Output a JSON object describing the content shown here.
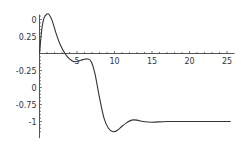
{
  "chart_data": {
    "type": "line",
    "title": "",
    "xlabel": "",
    "ylabel": "",
    "xlim": [
      0,
      26
    ],
    "ylim": [
      -1.2,
      0.6
    ],
    "grid": false,
    "legend": null,
    "x_ticks": [
      5,
      10,
      15,
      20,
      25
    ],
    "x_tick_labels": [
      "5",
      "10",
      "15",
      "20",
      "25"
    ],
    "y_ticks": [
      0.5,
      0.25,
      -0.25,
      -0.5,
      -0.75,
      -1
    ],
    "y_tick_labels": [
      "0",
      "0.25",
      "-0.25",
      "0",
      "-0.75",
      "-1"
    ],
    "series": [
      {
        "name": "curve",
        "color": "#333333",
        "x": [
          0,
          0.3,
          0.6,
          1.0,
          1.3,
          1.7,
          2.2,
          2.8,
          3.4,
          4.0,
          4.6,
          5.2,
          5.8,
          6.4,
          6.9,
          7.4,
          8.0,
          8.6,
          9.2,
          9.8,
          10.4,
          11.0,
          11.6,
          12.3,
          13.0,
          13.8,
          15,
          17,
          20,
          23,
          25.5
        ],
        "y": [
          0.0,
          0.35,
          0.52,
          0.58,
          0.57,
          0.48,
          0.3,
          0.12,
          0.0,
          -0.08,
          -0.12,
          -0.11,
          -0.09,
          -0.08,
          -0.12,
          -0.3,
          -0.65,
          -0.95,
          -1.1,
          -1.15,
          -1.13,
          -1.07,
          -1.02,
          -0.98,
          -0.98,
          -1.0,
          -1.01,
          -1.0,
          -1.0,
          -1.0,
          -1.0
        ]
      }
    ]
  }
}
